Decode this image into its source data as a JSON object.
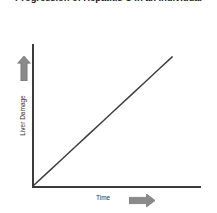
{
  "chart_data": {
    "type": "line",
    "title": "Progression of Hepatitis C in an Individual",
    "xlabel": "Time",
    "ylabel": "Liver Damage",
    "grid": false,
    "legend": false,
    "axis_ticks": "none",
    "annotations": {
      "y_axis_arrow": "up-arrow",
      "x_axis_arrow": "right-arrow"
    },
    "series": [
      {
        "name": "Liver Damage over Time",
        "x": [
          0,
          10,
          20,
          30,
          40,
          50,
          60,
          70,
          80,
          90,
          100
        ],
        "values": [
          0,
          10,
          20,
          30,
          40,
          50,
          60,
          70,
          80,
          90,
          100
        ]
      }
    ],
    "xlim": [
      0,
      120
    ],
    "ylim": [
      0,
      110
    ],
    "colors": {
      "axis": "#3a3a3a",
      "data_line": "#3f3f3f",
      "arrow": "#8a8a8a",
      "background": "#ffffff",
      "title_text": "#1d1d1d",
      "label_text": "#333333"
    }
  },
  "figure": {
    "title": "Progression of Hepatitis C in an Individual",
    "y_axis": {
      "label": "Liver Damage",
      "arrow_icon": "up-arrow-icon"
    },
    "x_axis": {
      "label": "Time",
      "arrow_icon": "right-arrow-icon"
    }
  }
}
